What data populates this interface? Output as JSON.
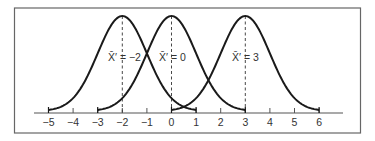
{
  "chart_data": {
    "type": "line",
    "title": "",
    "xlabel": "",
    "ylabel": "",
    "xlim": [
      -5.8,
      6.9
    ],
    "x_ticks": [
      -5,
      -4,
      -3,
      -2,
      -1,
      0,
      1,
      2,
      3,
      4,
      5,
      6
    ],
    "x_tick_labels": [
      "−5",
      "−4",
      "−3",
      "−2",
      "−1",
      "0",
      "1",
      "2",
      "3",
      "4",
      "5",
      "6"
    ],
    "grid": false,
    "legend": null,
    "series": [
      {
        "name": "X̄′ = −2",
        "mean": -2,
        "range": [
          -5,
          1
        ],
        "shape": "normal curve",
        "annotation": "X̄′ = −2"
      },
      {
        "name": "X̄′ = 0",
        "mean": 0,
        "range": [
          -3,
          3
        ],
        "shape": "normal curve",
        "annotation": "X̄′ = 0"
      },
      {
        "name": "X̄′ = 3",
        "mean": 3,
        "range": [
          0,
          6
        ],
        "shape": "normal curve",
        "annotation": "X̄′ = 3"
      }
    ],
    "reference_lines": [
      {
        "x": -2,
        "style": "dashed",
        "from": "axis",
        "to": "peak"
      },
      {
        "x": 0,
        "style": "dashed",
        "from": "axis",
        "to": "peak"
      },
      {
        "x": 3,
        "style": "dashed",
        "from": "axis",
        "to": "peak"
      }
    ]
  },
  "labels": {
    "curve1": "X̄′ = −2",
    "curve2": "X̄′ = 0",
    "curve3": "X̄′ = 3"
  },
  "ticks": [
    "−5",
    "−4",
    "−3",
    "−2",
    "−1",
    "0",
    "1",
    "2",
    "3",
    "4",
    "5",
    "6"
  ],
  "colors": {
    "line": "#1a1a1a",
    "frame": "#555555",
    "text": "#333333"
  }
}
